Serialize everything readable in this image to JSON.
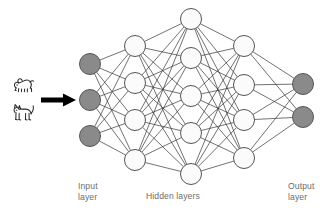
{
  "diagram": {
    "background_color": "#ffffff",
    "edge_color": "#3a3a3a",
    "node_outline_color": "#555555",
    "hidden_node_fill": "#fbfbfb",
    "io_node_fill": "#8a8a8a",
    "arrow_color": "#000000",
    "label_color": "#6d6d6d"
  },
  "labels": {
    "input_line1": "Input",
    "input_line2": "layer",
    "hidden": "Hidden layers",
    "output_line1": "Output",
    "output_line2": "layer"
  },
  "icons": {
    "dog": "dog-icon",
    "cat": "cat-icon",
    "arrow": "right-arrow-icon"
  },
  "network": {
    "layer_names": [
      "Input layer",
      "Hidden layer 1",
      "Hidden layer 2",
      "Hidden layer 3",
      "Output layer"
    ],
    "node_counts": [
      3,
      4,
      5,
      4,
      2
    ],
    "node_radius": 10.5,
    "fully_connected": true,
    "layers": [
      {
        "name": "input",
        "kind": "input",
        "fill": "#8a8a8a",
        "x": 90,
        "nodes": [
          {
            "id": "i1",
            "cx": 90,
            "cy": 64
          },
          {
            "id": "i2",
            "cx": 90,
            "cy": 100
          },
          {
            "id": "i3",
            "cx": 90,
            "cy": 136
          }
        ]
      },
      {
        "name": "hidden1",
        "kind": "hidden",
        "fill": "#fbfbfb",
        "x": 135,
        "nodes": [
          {
            "id": "h1a",
            "cx": 135,
            "cy": 46
          },
          {
            "id": "h1b",
            "cx": 135,
            "cy": 83
          },
          {
            "id": "h1c",
            "cx": 135,
            "cy": 120
          },
          {
            "id": "h1d",
            "cx": 135,
            "cy": 160
          }
        ]
      },
      {
        "name": "hidden2",
        "kind": "hidden",
        "fill": "#fbfbfb",
        "x": 191,
        "nodes": [
          {
            "id": "h2a",
            "cx": 191,
            "cy": 19
          },
          {
            "id": "h2b",
            "cx": 191,
            "cy": 58
          },
          {
            "id": "h2c",
            "cx": 191,
            "cy": 96
          },
          {
            "id": "h2d",
            "cx": 191,
            "cy": 133
          },
          {
            "id": "h2e",
            "cx": 191,
            "cy": 174
          }
        ]
      },
      {
        "name": "hidden3",
        "kind": "hidden",
        "fill": "#fbfbfb",
        "x": 244,
        "nodes": [
          {
            "id": "h3a",
            "cx": 244,
            "cy": 46
          },
          {
            "id": "h3b",
            "cx": 244,
            "cy": 85
          },
          {
            "id": "h3c",
            "cx": 244,
            "cy": 120
          },
          {
            "id": "h3d",
            "cx": 244,
            "cy": 158
          }
        ]
      },
      {
        "name": "output",
        "kind": "output",
        "fill": "#8a8a8a",
        "x": 303,
        "nodes": [
          {
            "id": "o1",
            "cx": 303,
            "cy": 84
          },
          {
            "id": "o2",
            "cx": 303,
            "cy": 117
          }
        ]
      }
    ]
  }
}
